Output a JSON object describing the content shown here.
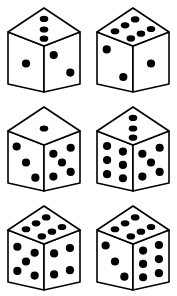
{
  "figure": {
    "background_color": "#ffffff",
    "ink_color": "#000000",
    "pip_color": "#000000",
    "face_color": "#ffffff",
    "stroke_width": 1.6,
    "columns": 2,
    "rows": 3
  },
  "dice": [
    {
      "id": "die-1",
      "position": "top-left",
      "row": 1,
      "column": 1,
      "top_face": 3,
      "left_face": 1,
      "right_face": 2,
      "total_visible": 6
    },
    {
      "id": "die-2",
      "position": "top-right",
      "row": 1,
      "column": 2,
      "top_face": 6,
      "left_face": 2,
      "right_face": 1,
      "total_visible": 9
    },
    {
      "id": "die-3",
      "position": "middle-left",
      "row": 2,
      "column": 1,
      "top_face": 1,
      "left_face": 3,
      "right_face": 5,
      "total_visible": 9
    },
    {
      "id": "die-4",
      "position": "middle-right",
      "row": 2,
      "column": 2,
      "top_face": 3,
      "left_face": 6,
      "right_face": 5,
      "total_visible": 14
    },
    {
      "id": "die-5",
      "position": "bottom-left",
      "row": 3,
      "column": 1,
      "top_face": 6,
      "left_face": 5,
      "right_face": 4,
      "total_visible": 15
    },
    {
      "id": "die-6",
      "position": "bottom-right",
      "row": 3,
      "column": 2,
      "top_face": 6,
      "left_face": 3,
      "right_face": 6,
      "total_visible": 15
    }
  ]
}
